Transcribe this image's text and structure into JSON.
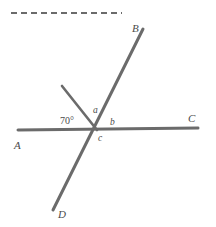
{
  "figure": {
    "type": "geometry-diagram",
    "background_color": "#ffffff",
    "stroke_color": "#6b6b6b",
    "label_color": "#4a4a4a",
    "intersection": {
      "x": 96,
      "y": 129
    },
    "lines": [
      {
        "name": "line-AC",
        "from_label": "A",
        "to_label": "C",
        "x1": 18,
        "y1": 130,
        "x2": 198,
        "y2": 128,
        "width": 3
      },
      {
        "name": "line-DB",
        "from_label": "D",
        "to_label": "B",
        "x1": 53,
        "y1": 210,
        "x2": 143,
        "y2": 29,
        "width": 3
      },
      {
        "name": "ray-seventy",
        "from_label": "",
        "to_label": "",
        "x1": 62,
        "y1": 86,
        "x2": 97,
        "y2": 130,
        "width": 2.6
      }
    ],
    "dashed_rule": {
      "x1": 11,
      "y1": 13,
      "x2": 122,
      "y2": 13,
      "width": 2,
      "dash": "6 4"
    },
    "point_labels": [
      {
        "id": "label-A",
        "text": "A",
        "x": 14,
        "y": 140
      },
      {
        "id": "label-B",
        "text": "B",
        "x": 132,
        "y": 23
      },
      {
        "id": "label-C",
        "text": "C",
        "x": 188,
        "y": 113
      },
      {
        "id": "label-D",
        "text": "D",
        "x": 58,
        "y": 209
      }
    ],
    "angle_labels": [
      {
        "id": "angle-a",
        "text": "a",
        "x": 93,
        "y": 106
      },
      {
        "id": "angle-b",
        "text": "b",
        "x": 110,
        "y": 118
      },
      {
        "id": "angle-c",
        "text": "c",
        "x": 98,
        "y": 134
      }
    ],
    "measured_angle": {
      "id": "angle-70",
      "text": "70°",
      "x": 60,
      "y": 116,
      "value": 70,
      "unit": "degrees"
    }
  }
}
